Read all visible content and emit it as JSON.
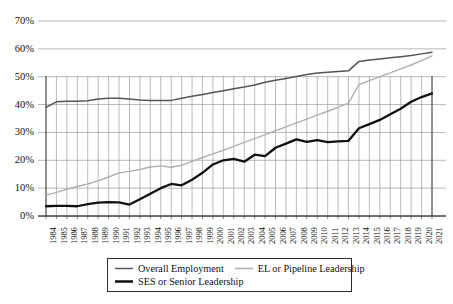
{
  "chart_data": {
    "type": "line",
    "title": "",
    "xlabel": "",
    "ylabel": "",
    "ylim": [
      0,
      70
    ],
    "ytick_labels": [
      "0%",
      "10%",
      "20%",
      "30%",
      "40%",
      "50%",
      "60%",
      "70%"
    ],
    "ytick_values": [
      0,
      10,
      20,
      30,
      40,
      50,
      60,
      70
    ],
    "grid": true,
    "grid_horizontal": true,
    "grid_vertical": true,
    "legend_position": "bottom",
    "categories": [
      "1984",
      "1985",
      "1986",
      "1987",
      "1988",
      "1989",
      "1990",
      "1991",
      "1992",
      "1993",
      "1994",
      "1995",
      "1996",
      "1997",
      "1998",
      "1999",
      "2000",
      "2001",
      "2002",
      "2003",
      "2004",
      "2005",
      "2006",
      "2007",
      "2008",
      "2009",
      "2010",
      "2011",
      "2012",
      "2013",
      "2014",
      "2015",
      "2016",
      "2017",
      "2018",
      "2019",
      "2020",
      "2021"
    ],
    "series": [
      {
        "name": "Overall Employment",
        "color": "#555555",
        "width": 1.5,
        "values": [
          39.0,
          41.0,
          41.2,
          41.2,
          41.4,
          42.0,
          42.3,
          42.3,
          42.0,
          41.6,
          41.5,
          41.5,
          41.5,
          42.3,
          43.0,
          43.6,
          44.3,
          45.0,
          45.7,
          46.3,
          47.0,
          48.0,
          48.7,
          49.4,
          50.1,
          50.8,
          51.3,
          51.6,
          51.9,
          52.1,
          55.5,
          56.0,
          56.4,
          56.8,
          57.2,
          57.6,
          58.2,
          58.8
        ]
      },
      {
        "name": "EL or Pipeline Leadership",
        "color": "#b0b0b0",
        "width": 1.4,
        "values": [
          7.5,
          8.5,
          9.6,
          10.6,
          11.5,
          12.6,
          14.0,
          15.5,
          16.0,
          16.7,
          17.6,
          18.0,
          17.5,
          18.2,
          19.6,
          21.0,
          22.3,
          23.6,
          25.0,
          26.4,
          27.8,
          29.2,
          30.6,
          32.0,
          33.4,
          34.8,
          36.2,
          37.6,
          39.0,
          40.5,
          47.2,
          48.6,
          50.0,
          51.4,
          52.8,
          54.2,
          55.8,
          57.5
        ]
      },
      {
        "name": "SES or Senior Leadership",
        "color": "#111111",
        "width": 2.3,
        "values": [
          3.5,
          3.6,
          3.6,
          3.5,
          4.3,
          4.8,
          5.0,
          4.9,
          4.1,
          6.0,
          8.0,
          10.0,
          11.5,
          11.0,
          13.0,
          15.5,
          18.5,
          20.0,
          20.5,
          19.5,
          22.0,
          21.5,
          24.5,
          26.0,
          27.5,
          26.6,
          27.2,
          26.5,
          26.8,
          27.0,
          31.5,
          33.0,
          34.5,
          36.5,
          38.5,
          41.0,
          42.7,
          44.0
        ]
      }
    ]
  },
  "legend": {
    "entries": [
      {
        "label": "Overall Employment",
        "icon": "line-swatch-overall"
      },
      {
        "label": "EL or Pipeline Leadership",
        "icon": "line-swatch-el"
      },
      {
        "label": "SES or Senior Leadership",
        "icon": "line-swatch-ses"
      }
    ]
  },
  "axes": {
    "y_axis_name": "percent-axis",
    "x_axis_name": "year-axis"
  }
}
